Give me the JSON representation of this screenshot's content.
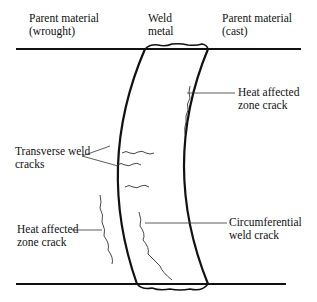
{
  "labels": {
    "parent_wrought": "Parent material\n(wrought)",
    "weld_metal": "Weld\nmetal",
    "parent_cast": "Parent material\n(cast)",
    "haz_crack_right": "Heat affected\nzone crack",
    "transverse": "Transverse weld\ncracks",
    "haz_crack_left": "Heat affected\nzone crack",
    "circumferential": "Circumferential\nweld crack"
  }
}
